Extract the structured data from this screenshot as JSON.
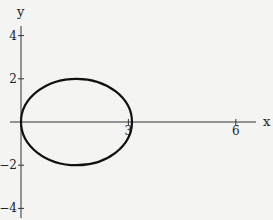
{
  "chart_data": {
    "type": "line",
    "title": "",
    "xlabel": "x",
    "ylabel": "y",
    "xlim": [
      -0.3,
      6.6
    ],
    "ylim": [
      -4.5,
      4.5
    ],
    "grid": false,
    "legend": null,
    "x_ticks": [
      {
        "value": 3,
        "label": "3"
      },
      {
        "value": 6,
        "label": "6"
      }
    ],
    "y_ticks": [
      {
        "value": 4,
        "label": "4"
      },
      {
        "value": 2,
        "label": "2"
      },
      {
        "value": -2,
        "label": "-2"
      },
      {
        "value": -4,
        "label": "-4"
      }
    ],
    "series": [
      {
        "name": "closed curve",
        "shape": "ellipse",
        "center": [
          1.55,
          0
        ],
        "semi_axis_x": 1.55,
        "semi_axis_y": 2,
        "points": [
          [
            0,
            0
          ],
          [
            0.45,
            1.4
          ],
          [
            1.55,
            2
          ],
          [
            2.65,
            1.4
          ],
          [
            3.1,
            0
          ],
          [
            2.65,
            -1.4
          ],
          [
            1.55,
            -2
          ],
          [
            0.45,
            -1.4
          ],
          [
            0,
            0
          ]
        ]
      }
    ]
  }
}
